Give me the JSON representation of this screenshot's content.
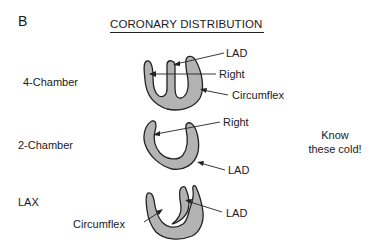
{
  "panel_label": "B",
  "title": "CORONARY DISTRIBUTION",
  "views": [
    {
      "name": "4-Chamber",
      "labels": {
        "lad": "LAD",
        "right": "Right",
        "circumflex": "Circumflex"
      }
    },
    {
      "name": "2-Chamber",
      "labels": {
        "right": "Right",
        "lad": "LAD"
      }
    },
    {
      "name": "LAX",
      "labels": {
        "circumflex": "Circumflex",
        "lad": "LAD"
      }
    }
  ],
  "note": {
    "line1": "Know",
    "line2": "these cold!"
  },
  "colors": {
    "fill": "#b3b3b3",
    "stroke": "#222222",
    "text": "#1a1a1a"
  }
}
